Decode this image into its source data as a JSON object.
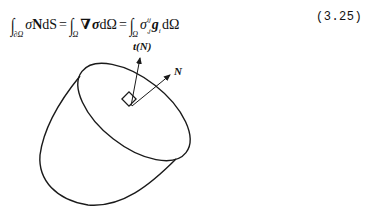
{
  "equation": {
    "lhs": {
      "integral_domain": "∂Ω",
      "integrand_sigma": "σ",
      "integrand_N": "N",
      "differential": "dS"
    },
    "middle": {
      "integral_domain": "Ω",
      "nabla": "∇",
      "sigma": "σ",
      "differential": "dΩ"
    },
    "rhs": {
      "integral_domain": "Ω",
      "sigma": "σ",
      "sigma_superscript": "ij",
      "sigma_subscript": ",j",
      "g": "g",
      "g_subscript": "i",
      "differential": "dΩ"
    },
    "equals": "=",
    "integral_sign": "∫",
    "number": "(3.25)"
  },
  "figure": {
    "labels": {
      "traction": "t(N)",
      "normal": "N"
    },
    "stroke_color": "#1a1a1a"
  }
}
